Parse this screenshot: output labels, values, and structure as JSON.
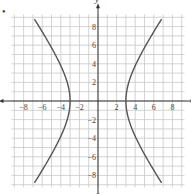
{
  "bullet": "•",
  "chart_data": {
    "type": "line",
    "title": "",
    "xlabel": "x",
    "ylabel": "y",
    "xlim": [
      -9,
      9
    ],
    "ylim": [
      -9,
      9
    ],
    "grid": true,
    "x_ticks": [
      -8,
      -6,
      -4,
      -2,
      2,
      4,
      6,
      8
    ],
    "y_ticks": [
      8,
      6,
      4,
      2,
      -2,
      -4,
      -6,
      -8
    ],
    "x_tick_labels": [
      "−8",
      "−6",
      "−4",
      "−2",
      "2",
      "4",
      "6",
      "8"
    ],
    "y_tick_labels": [
      "8",
      "6",
      "4",
      "2",
      "−2",
      "−4",
      "−6",
      "−8"
    ],
    "series": [
      {
        "name": "hyperbola",
        "equation": "x^2/9 - y^2/... = 1",
        "vertices": [
          [
            -3,
            0
          ],
          [
            3,
            0
          ]
        ],
        "right_branch": [
          [
            7.1,
            8.8
          ],
          [
            5.5,
            6
          ],
          [
            4.3,
            3.5
          ],
          [
            3.5,
            1.5
          ],
          [
            3,
            0
          ],
          [
            3.5,
            -1.5
          ],
          [
            4.3,
            -3.5
          ],
          [
            5.5,
            -6
          ],
          [
            7.1,
            -8.8
          ]
        ],
        "left_branch": [
          [
            -7.1,
            8.8
          ],
          [
            -5.5,
            6
          ],
          [
            -4.3,
            3.5
          ],
          [
            -3.5,
            1.5
          ],
          [
            -3,
            0
          ],
          [
            -3.5,
            -1.5
          ],
          [
            -4.3,
            -3.5
          ],
          [
            -5.5,
            -6
          ],
          [
            -7.1,
            -8.8
          ]
        ]
      }
    ],
    "colors": {
      "curve": "#555555",
      "grid": "#c8c8c8",
      "axis": "#333333"
    }
  }
}
